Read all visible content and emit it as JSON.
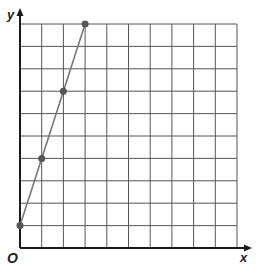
{
  "chart_data": {
    "type": "line",
    "title": "",
    "xlabel": "x",
    "ylabel": "y",
    "origin_label": "O",
    "xlim": [
      0,
      10
    ],
    "ylim": [
      0,
      10
    ],
    "grid": true,
    "grid_cells": {
      "x": 10,
      "y": 10
    },
    "tick_labels": {
      "x": [],
      "y": []
    },
    "series": [
      {
        "name": "line",
        "x": [
          0,
          1,
          2,
          3
        ],
        "y": [
          1,
          4,
          7,
          10
        ],
        "markers": true
      }
    ],
    "colors": {
      "grid": "#555555",
      "axis": "#1a1a1a",
      "line": "#777777",
      "marker": "#555555"
    }
  }
}
